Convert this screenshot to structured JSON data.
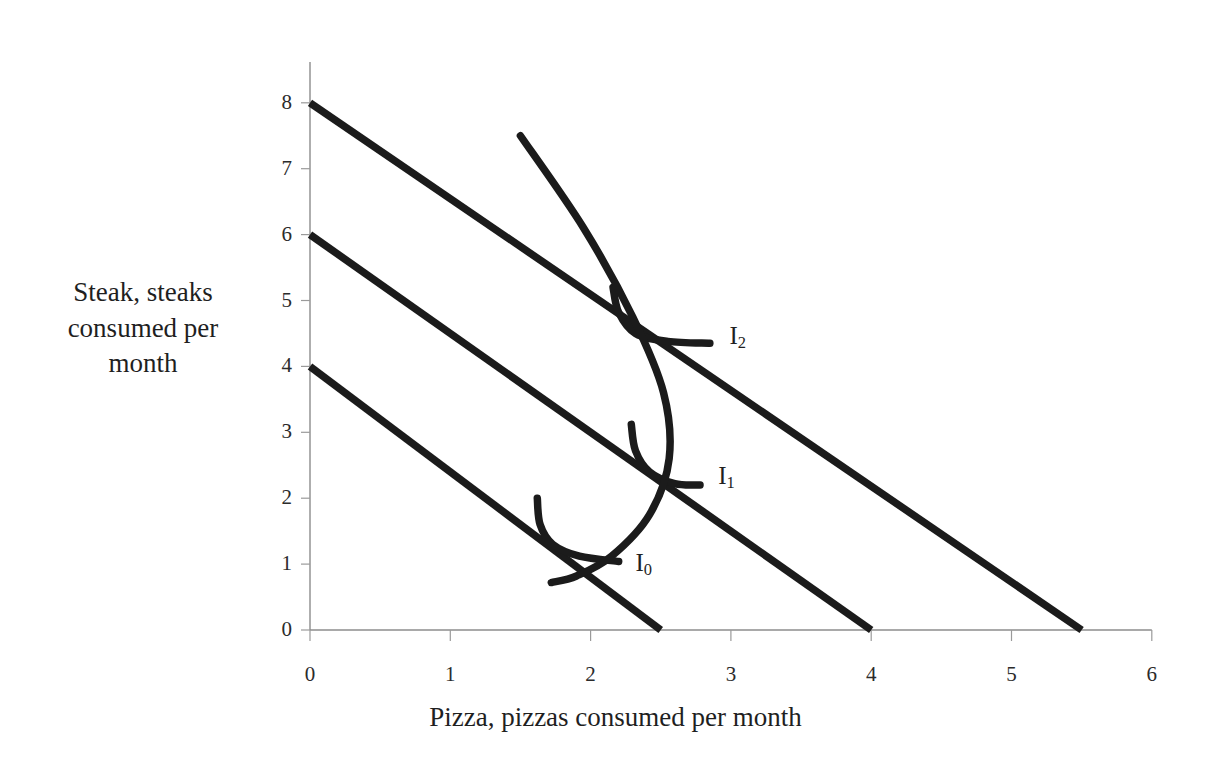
{
  "chart_data": {
    "type": "line",
    "title": "",
    "xlabel": "Pizza, pizzas consumed per month",
    "ylabel": "Steak, steaks consumed per month",
    "xlim": [
      0,
      6
    ],
    "ylim": [
      0,
      8
    ],
    "xticks": [
      "0",
      "1",
      "2",
      "3",
      "4",
      "5",
      "6"
    ],
    "yticks": [
      "0",
      "1",
      "2",
      "3",
      "4",
      "5",
      "6",
      "7",
      "8"
    ],
    "grid": false,
    "legend_position": "inline-right-of-curves",
    "line_color": "#1b1b1b",
    "axis_color": "#8c8c8c",
    "budget_lines": [
      {
        "name": "budget-line-0",
        "y_intercept": 4,
        "x_intercept": 2.5,
        "slope": -1.6
      },
      {
        "name": "budget-line-1",
        "y_intercept": 6,
        "x_intercept": 4,
        "slope": -1.5
      },
      {
        "name": "budget-line-2",
        "y_intercept": 8,
        "x_intercept": 5.5,
        "slope": -1.4545
      }
    ],
    "price_consumption_curve": {
      "name": "price-consumption-curve",
      "points": [
        [
          1.5,
          7.5
        ],
        [
          1.95,
          6.1
        ],
        [
          2.3,
          4.75
        ],
        [
          2.52,
          3.6
        ],
        [
          2.56,
          2.6
        ],
        [
          2.42,
          1.75
        ],
        [
          2.15,
          1.12
        ],
        [
          1.9,
          0.82
        ],
        [
          1.72,
          0.72
        ]
      ]
    },
    "indifference_curves": [
      {
        "label": "I",
        "subscript": "0",
        "name": "indifference-curve-i0",
        "tangency_point": [
          1.71,
          1.33
        ],
        "points": [
          [
            1.62,
            2.0
          ],
          [
            1.64,
            1.6
          ],
          [
            1.73,
            1.3
          ],
          [
            1.92,
            1.12
          ],
          [
            2.2,
            1.04
          ]
        ],
        "label_position": [
          2.32,
          1.0
        ]
      },
      {
        "label": "I",
        "subscript": "1",
        "name": "indifference-curve-i1",
        "tangency_point": [
          2.35,
          2.45
        ],
        "points": [
          [
            2.29,
            3.12
          ],
          [
            2.32,
            2.72
          ],
          [
            2.42,
            2.4
          ],
          [
            2.6,
            2.22
          ],
          [
            2.78,
            2.2
          ]
        ],
        "label_position": [
          2.91,
          2.32
        ]
      },
      {
        "label": "I",
        "subscript": "2",
        "name": "indifference-curve-i2",
        "tangency_point": [
          2.4,
          4.6
        ],
        "points": [
          [
            2.16,
            5.2
          ],
          [
            2.2,
            4.82
          ],
          [
            2.32,
            4.5
          ],
          [
            2.55,
            4.38
          ],
          [
            2.85,
            4.35
          ]
        ],
        "label_position": [
          2.99,
          4.45
        ]
      }
    ]
  },
  "axis_titles": {
    "y_lines": [
      "Steak, steaks",
      "consumed per",
      "month"
    ],
    "x": "Pizza, pizzas consumed per month"
  }
}
